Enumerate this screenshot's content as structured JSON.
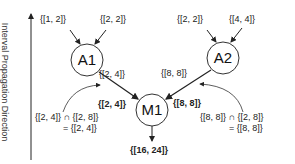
{
  "axis": {
    "label": "Interval Propagation Direction"
  },
  "nodes": {
    "a1": {
      "label": "A1"
    },
    "a2": {
      "label": "A2"
    },
    "m1": {
      "label": "M1"
    }
  },
  "edges": {
    "a1_in_left": "{[1, 2]}",
    "a1_in_right": "{[2, 2]}",
    "a2_in_left": "{[2, 2]}",
    "a2_in_right": "{[4, 4]}",
    "a1_out": "{[2, 4]}",
    "a2_out": "{[8, 8]}",
    "m1_in_left": "{[2, 4]}",
    "m1_in_right": "{[8, 8]}",
    "m1_out": "{[16, 24]}"
  },
  "annotations": {
    "left_line1_a": "{[2, 4]}",
    "left_line1_op": "∩",
    "left_line1_b": "{[2, 8]}",
    "left_line2": "= {[2, 4]}",
    "right_line1_a": "{[8, 8]}",
    "right_line1_op": "∩",
    "right_line1_b": "{[2, 8]}",
    "right_line2": "= {[8, 8]}"
  }
}
